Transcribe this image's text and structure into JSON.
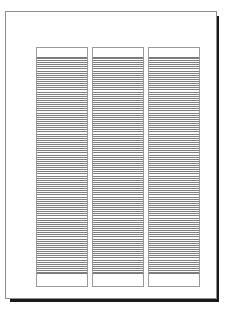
{
  "document": {
    "title": "",
    "page_background": "#ffffff",
    "sheet_border_color": "#8f8f8f",
    "shadow_color": "#1a1a1a"
  },
  "panels": [
    {
      "id": "panel-left",
      "label": "",
      "border_color": "#9a9a9a",
      "stripe_color": "#7f7f7f",
      "gap_color": "#fdfdfd",
      "stripe_count": 104
    },
    {
      "id": "panel-center",
      "label": "",
      "border_color": "#9a9a9a",
      "stripe_color": "#7f7f7f",
      "gap_color": "#fdfdfd",
      "stripe_count": 104
    },
    {
      "id": "panel-right",
      "label": "",
      "border_color": "#9a9a9a",
      "stripe_color": "#7f7f7f",
      "gap_color": "#fdfdfd",
      "stripe_count": 104
    }
  ]
}
